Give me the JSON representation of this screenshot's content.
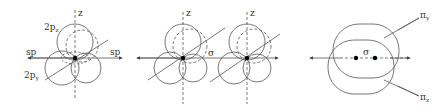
{
  "diagram": {
    "panels": [
      {
        "id": "single-atom",
        "labels": {
          "z_axis": "z",
          "p_z": "2p",
          "p_z_sub": "z",
          "p_y": "2p",
          "p_y_sub": "y",
          "sp_left": "sp",
          "sp_right": "sp"
        }
      },
      {
        "id": "two-atoms-overlap",
        "labels": {
          "z_axis_left": "z",
          "z_axis_right": "z",
          "sigma": "σ"
        }
      },
      {
        "id": "molecule",
        "labels": {
          "sigma": "σ",
          "pi_y": "π",
          "pi_y_sub": "y",
          "pi_z": "π",
          "pi_z_sub": "z"
        }
      }
    ],
    "colors": {
      "line": "#555555",
      "dot": "#000000",
      "background": "#ffffff"
    }
  }
}
